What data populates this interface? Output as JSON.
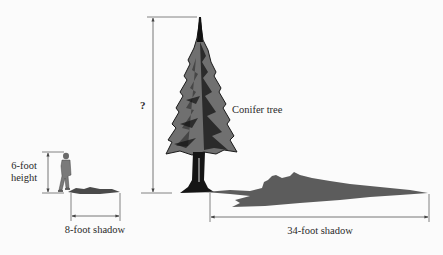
{
  "diagram": {
    "type": "similar-triangles-shadow-problem",
    "colors": {
      "line": "#555555",
      "tree_foliage": "#6e6e6e",
      "tree_dark": "#1a1a1a",
      "shadow": "#5a5a5a",
      "background": "#fbfbfb"
    },
    "person": {
      "height_label_line1": "6-foot",
      "height_label_line2": "height",
      "shadow_label": "8-foot shadow",
      "height_ft": 6,
      "shadow_ft": 8
    },
    "tree": {
      "name_label": "Conifer tree",
      "height_label": "?",
      "shadow_label": "34-foot shadow",
      "shadow_ft": 34
    }
  }
}
